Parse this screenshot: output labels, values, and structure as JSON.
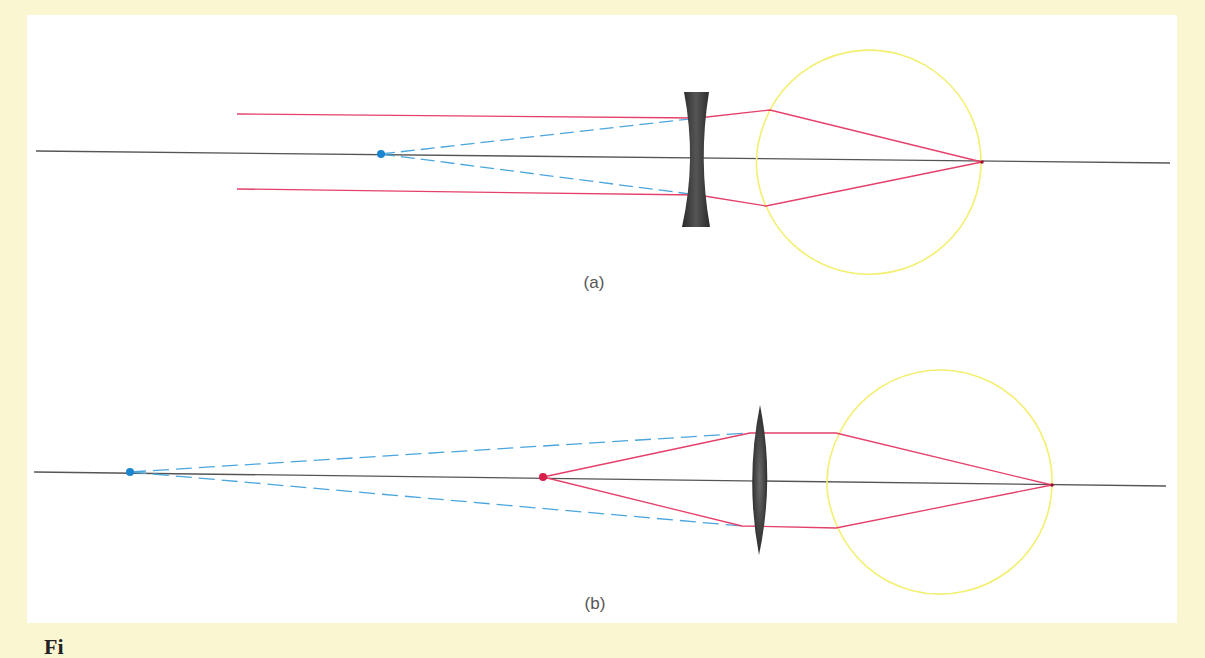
{
  "figure": {
    "caption_partial": "Fi",
    "colors": {
      "background": "#fbf6d2",
      "panel": "#ffffff",
      "optical_axis": "#555555",
      "real_ray": "#e4406a",
      "virtual_ray": "#4aa6dc",
      "eye_outline": "#f3ef70",
      "lens": "#3a3a3a",
      "object_point_blue": "#1a86d0",
      "object_point_red": "#d6204a"
    },
    "panels": [
      {
        "id": "a",
        "label": "(a)",
        "description": "Myopia corrected with a diverging (concave) lens",
        "lens_type": "concave",
        "far_point_marker": "blue-dot"
      },
      {
        "id": "b",
        "label": "(b)",
        "description": "Hyperopia corrected with a converging (convex) lens",
        "lens_type": "convex",
        "object_marker": "red-dot",
        "near_point_marker": "blue-dot"
      }
    ]
  }
}
